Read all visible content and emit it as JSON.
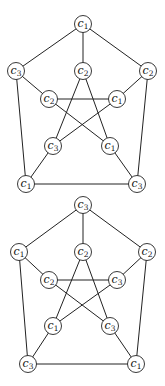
{
  "graphs": [
    {
      "name": "petersen-coloring-1",
      "nodes": [
        {
          "id": "o0",
          "x": 83,
          "y": 24,
          "label": "c",
          "sub": "1"
        },
        {
          "id": "o1",
          "x": 16,
          "y": 71,
          "label": "c",
          "sub": "3"
        },
        {
          "id": "o2",
          "x": 148,
          "y": 71,
          "label": "c",
          "sub": "2"
        },
        {
          "id": "o3",
          "x": 26,
          "y": 184,
          "label": "c",
          "sub": "1"
        },
        {
          "id": "o4",
          "x": 137,
          "y": 184,
          "label": "c",
          "sub": "3"
        },
        {
          "id": "i0",
          "x": 83,
          "y": 71,
          "label": "c",
          "sub": "2"
        },
        {
          "id": "i1",
          "x": 49,
          "y": 99,
          "label": "c",
          "sub": "2"
        },
        {
          "id": "i2",
          "x": 117,
          "y": 99,
          "label": "c",
          "sub": "1"
        },
        {
          "id": "i3",
          "x": 53,
          "y": 146,
          "label": "c",
          "sub": "3"
        },
        {
          "id": "i4",
          "x": 110,
          "y": 146,
          "label": "c",
          "sub": "1"
        }
      ]
    },
    {
      "name": "petersen-coloring-2",
      "nodes": [
        {
          "id": "o0",
          "x": 83,
          "y": 205,
          "label": "c",
          "sub": "3"
        },
        {
          "id": "o1",
          "x": 19,
          "y": 252,
          "label": "c",
          "sub": "1"
        },
        {
          "id": "o2",
          "x": 147,
          "y": 252,
          "label": "c",
          "sub": "2"
        },
        {
          "id": "o3",
          "x": 28,
          "y": 364,
          "label": "c",
          "sub": "3"
        },
        {
          "id": "o4",
          "x": 136,
          "y": 364,
          "label": "c",
          "sub": "1"
        },
        {
          "id": "i0",
          "x": 83,
          "y": 252,
          "label": "c",
          "sub": "2"
        },
        {
          "id": "i1",
          "x": 49,
          "y": 280,
          "label": "c",
          "sub": "2"
        },
        {
          "id": "i2",
          "x": 117,
          "y": 280,
          "label": "c",
          "sub": "3"
        },
        {
          "id": "i3",
          "x": 53,
          "y": 326,
          "label": "c",
          "sub": "1"
        },
        {
          "id": "i4",
          "x": 110,
          "y": 326,
          "label": "c",
          "sub": "3"
        }
      ]
    }
  ],
  "edges": [
    [
      "o0",
      "o1"
    ],
    [
      "o0",
      "o2"
    ],
    [
      "o1",
      "o3"
    ],
    [
      "o2",
      "o4"
    ],
    [
      "o3",
      "o4"
    ],
    [
      "o0",
      "i0"
    ],
    [
      "o1",
      "i1"
    ],
    [
      "o2",
      "i2"
    ],
    [
      "o3",
      "i3"
    ],
    [
      "o4",
      "i4"
    ],
    [
      "i0",
      "i3"
    ],
    [
      "i0",
      "i4"
    ],
    [
      "i1",
      "i2"
    ],
    [
      "i1",
      "i4"
    ],
    [
      "i2",
      "i3"
    ]
  ],
  "node_radius": 8.5
}
